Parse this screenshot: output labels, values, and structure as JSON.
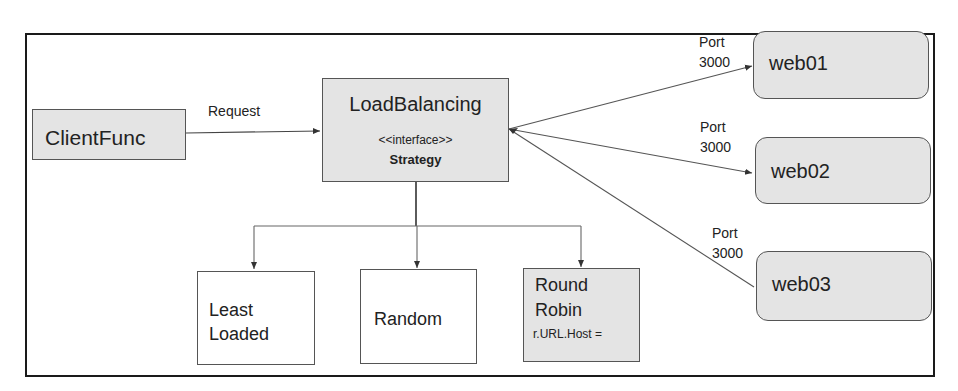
{
  "diagram": {
    "client": {
      "label": "ClientFunc"
    },
    "request_edge": {
      "label": "Request"
    },
    "load_balancer": {
      "title": "LoadBalancing",
      "stereotype": "<<interface>>",
      "name": "Strategy"
    },
    "servers": [
      {
        "label": "web01",
        "port_line1": "Port",
        "port_line2": "3000"
      },
      {
        "label": "web02",
        "port_line1": "Port",
        "port_line2": "3000"
      },
      {
        "label": "web03",
        "port_line1": "Port",
        "port_line2": "3000"
      }
    ],
    "strategies": [
      {
        "line1": "Least",
        "line2": "Loaded"
      },
      {
        "line1": "Random"
      },
      {
        "line1": "Round",
        "line2": "Robin",
        "sub": "r.URL.Host ="
      }
    ]
  },
  "colors": {
    "shaded_fill": "#e4e4e4",
    "border": "#555555",
    "frame": "#1a1a1a",
    "line": "#444444"
  }
}
